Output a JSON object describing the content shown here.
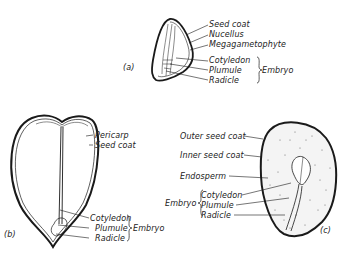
{
  "figure": {
    "panels": [
      {
        "id": "a",
        "caption": "(a)",
        "labels": [
          "Seed coat",
          "Nucellus",
          "Megagametophyte"
        ],
        "embryo_parts": [
          "Cotyledon",
          "Plumule",
          "Radicle"
        ],
        "embryo_group_label": "Embryo"
      },
      {
        "id": "b",
        "caption": "(b)",
        "labels": [
          "Pericarp",
          "Seed coat"
        ],
        "embryo_parts": [
          "Cotyledon",
          "Plumule",
          "Radicle"
        ],
        "embryo_group_label": "Embryo"
      },
      {
        "id": "c",
        "caption": "(c)",
        "labels": [
          "Outer seed coat",
          "Inner seed coat",
          "Endosperm"
        ],
        "embryo_parts": [
          "Cotyledon",
          "Plumule",
          "Radicle"
        ],
        "embryo_group_label": "Embryo"
      }
    ]
  },
  "colors": {
    "ink": "#1a1a1a",
    "background": "#ffffff"
  }
}
